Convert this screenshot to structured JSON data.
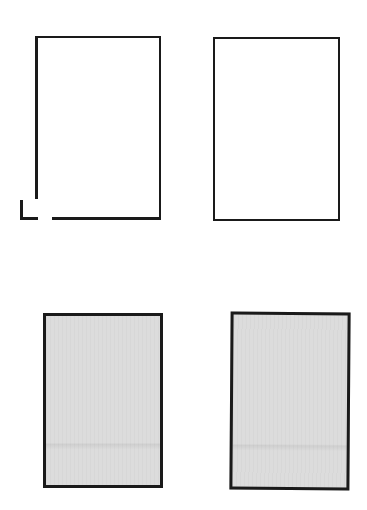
{
  "shapes": {
    "top_left": {
      "kind": "outlined-rectangle",
      "fill": "#ffffff",
      "stroke": "#1a1a1a",
      "note": "bottom-left corner broken with detached corner mark"
    },
    "top_right": {
      "kind": "outlined-rectangle",
      "fill": "#ffffff",
      "stroke": "#1a1a1a"
    },
    "bottom_left": {
      "kind": "filled-rectangle",
      "fill": "#dcdcdc",
      "stroke": "#1a1a1a"
    },
    "bottom_right": {
      "kind": "filled-rectangle",
      "fill": "#dcdcdc",
      "stroke": "#1a1a1a"
    }
  }
}
